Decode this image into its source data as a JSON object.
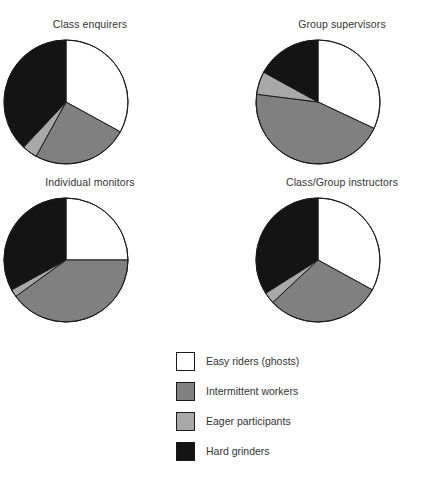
{
  "chart_data": {
    "type": "pie",
    "title": "",
    "legend_position": "bottom-center",
    "categories": [
      "Easy riders (ghosts)",
      "Intermittent workers",
      "Eager participants",
      "Hard grinders"
    ],
    "colors": [
      "#ffffff",
      "#808080",
      "#a8a8a8",
      "#141414"
    ],
    "outline_color": "#1a1a1a",
    "start_angle_deg": 0,
    "direction": "clockwise",
    "panels": [
      {
        "title": "Class enquirers",
        "values": [
          33,
          25,
          4,
          38
        ]
      },
      {
        "title": "Group supervisors",
        "values": [
          32,
          45,
          6,
          17
        ]
      },
      {
        "title": "Individual monitors",
        "values": [
          25,
          40,
          2,
          33
        ]
      },
      {
        "title": "Class/Group instructors",
        "values": [
          33,
          30,
          3,
          34
        ]
      }
    ]
  },
  "panels": [
    {
      "title": "Class enquirers"
    },
    {
      "title": "Group supervisors"
    },
    {
      "title": "Individual monitors"
    },
    {
      "title": "Class/Group instructors"
    }
  ],
  "legend": {
    "items": [
      {
        "label": "Easy riders (ghosts)",
        "color": "#ffffff",
        "icon": "legend-swatch-white"
      },
      {
        "label": "Intermittent workers",
        "color": "#808080",
        "icon": "legend-swatch-gray"
      },
      {
        "label": "Eager participants",
        "color": "#a8a8a8",
        "icon": "legend-swatch-light-gray"
      },
      {
        "label": "Hard grinders",
        "color": "#141414",
        "icon": "legend-swatch-black"
      }
    ]
  }
}
